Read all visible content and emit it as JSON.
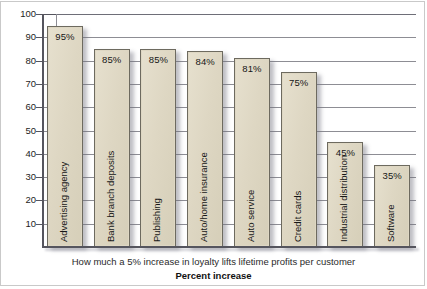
{
  "chart_data": {
    "type": "bar",
    "title": "How much a 5% increase in loyalty lifts lifetime profits per customer",
    "xlabel": "Percent increase",
    "ylabel": "",
    "ylim": [
      0,
      100
    ],
    "yticks": [
      100,
      90,
      80,
      70,
      60,
      50,
      40,
      30,
      20,
      10
    ],
    "ytick_labels": [
      "100",
      "90",
      "80",
      "70",
      "60",
      "50",
      "40",
      "30",
      "20",
      "10"
    ],
    "grid": true,
    "legend": false,
    "categories": [
      "Advertising agency",
      "Bank branch deposits",
      "Publishing",
      "Auto/home insurance",
      "Auto service",
      "Credit cards",
      "Industrial distribution",
      "Software"
    ],
    "values": [
      95,
      85,
      85,
      84,
      81,
      75,
      45,
      35
    ],
    "data_labels": [
      "95%",
      "85%",
      "85%",
      "84%",
      "81%",
      "75%",
      "45%",
      "35%"
    ],
    "bar_fill_color": "#ded7c3",
    "bar_border_color": "#6d6a5f",
    "gridline_color": "#8d8d94",
    "axis_color": "#55555e"
  },
  "captions": {
    "main": "How much a 5% increase in loyalty lifts lifetime profits per customer",
    "axis": "Percent increase"
  }
}
